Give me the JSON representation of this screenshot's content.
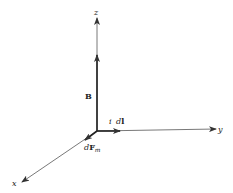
{
  "diagram": {
    "axes": {
      "x_label": "x",
      "y_label": "y",
      "z_label": "z"
    },
    "vectors": {
      "B_label": "B",
      "idl_label_i": "i",
      "idl_label_d": "d",
      "idl_label_l": "l",
      "dFm_label_d": "d",
      "dFm_label_F": "F",
      "dFm_label_m": "m"
    },
    "colors": {
      "line": "#333333",
      "background": "#ffffff"
    }
  }
}
